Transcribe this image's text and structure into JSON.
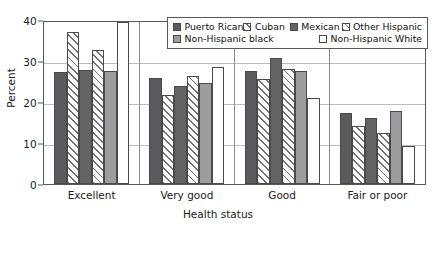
{
  "chart_data": {
    "type": "bar",
    "title": "",
    "xlabel": "Health status",
    "ylabel": "Percent",
    "ylim": [
      0,
      40
    ],
    "yticks": [
      0,
      10,
      20,
      30,
      40
    ],
    "grid": true,
    "legend_position": "top-right inside",
    "categories": [
      "Excellent",
      "Very good",
      "Good",
      "Fair or poor"
    ],
    "series": [
      {
        "name": "Puerto Rican",
        "pattern": "solid-dark",
        "values": [
          27.7,
          26.3,
          28.0,
          17.5
        ]
      },
      {
        "name": "Cuban",
        "pattern": "diagonal",
        "values": [
          37.5,
          22.0,
          26.0,
          14.3
        ]
      },
      {
        "name": "Mexican",
        "pattern": "solid-mid",
        "values": [
          28.2,
          24.2,
          31.0,
          16.2
        ]
      },
      {
        "name": "Other Hispanic",
        "pattern": "crosshatch",
        "values": [
          33.0,
          26.7,
          28.5,
          12.5
        ]
      },
      {
        "name": "Non-Hispanic black",
        "pattern": "solid-light",
        "values": [
          27.8,
          25.0,
          28.0,
          18.0
        ]
      },
      {
        "name": "Non-Hispanic White",
        "pattern": "white",
        "values": [
          40.0,
          29.0,
          21.3,
          9.5
        ]
      }
    ]
  },
  "axes": {
    "y_title": "Percent",
    "x_title": "Health status",
    "y_tick_labels": [
      "40",
      "30",
      "20",
      "10",
      "0"
    ]
  },
  "legend": {
    "row1": [
      {
        "label": "Puerto Rican",
        "pattern": "solid-dark"
      },
      {
        "label": "Cuban",
        "pattern": "diagonal"
      },
      {
        "label": "Mexican",
        "pattern": "solid-mid"
      },
      {
        "label": "Other Hispanic",
        "pattern": "crosshatch"
      }
    ],
    "row2": [
      {
        "label": "Non-Hispanic black",
        "pattern": "solid-light"
      },
      {
        "label": "Non-Hispanic White",
        "pattern": "white"
      }
    ]
  },
  "colors": {
    "solid_dark": "#5b5b5d",
    "solid_mid": "#646466",
    "solid_light": "#9d9d9f",
    "hatch": "#6e6e70",
    "frame": "#58585a",
    "gridline": "#bcbcbe",
    "background": "#ffffff",
    "text": "#1a1a1a"
  }
}
